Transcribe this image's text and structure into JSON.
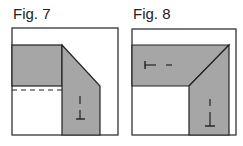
{
  "figures": [
    {
      "label": "Fig. 7",
      "fill": "#a6a6a6"
    },
    {
      "label": "Fig. 8",
      "fill": "#a6a6a6"
    }
  ]
}
